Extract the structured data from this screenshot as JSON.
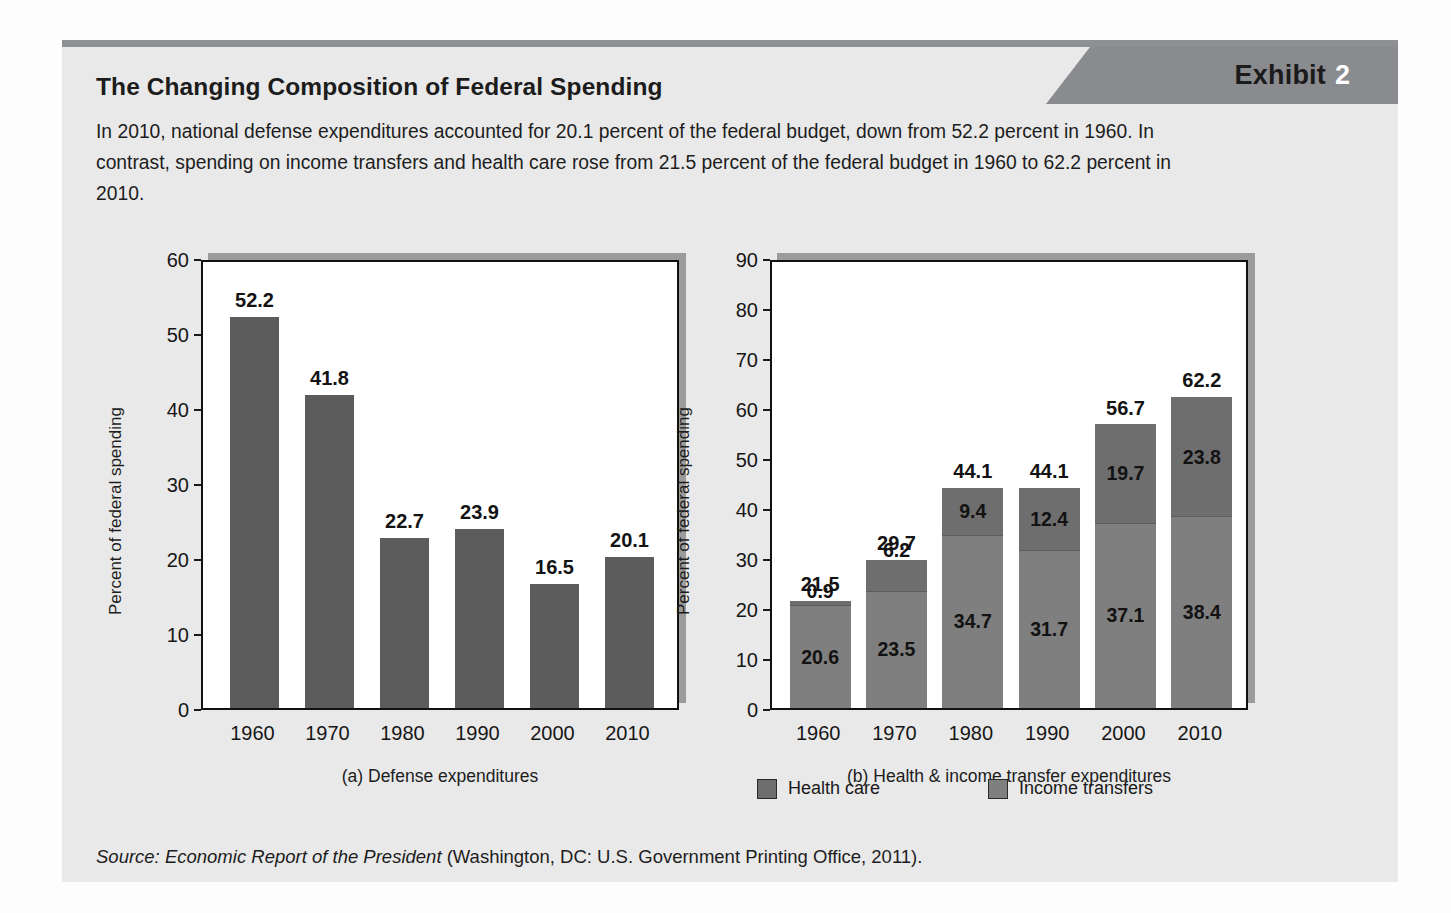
{
  "exhibit": {
    "banner_word": "Exhibit",
    "banner_number": "2",
    "title": "The Changing Composition of Federal Spending",
    "description": "In 2010, national defense expenditures accounted for 20.1 percent of the federal budget, down from 52.2 percent in 1960. In contrast, spending on income transfers and health care rose from 21.5 percent of the federal budget in 1960 to 62.2 percent in 2010.",
    "source_prefix": "Source: ",
    "source_italic": "Economic Report of the President",
    "source_rest": " (Washington, DC: U.S. Government Printing Office, 2011)."
  },
  "colors": {
    "panel_bg": "#e9e9e9",
    "banner": "#8a8b8e",
    "topbar": "#8f9093",
    "defense_bar": "#5c5c5c",
    "health_care": "#6e6e6e",
    "income_transfers": "#7f7f7f",
    "plot_shadow": "#9b9b9b"
  },
  "legend": {
    "items": [
      {
        "label": "Health care",
        "color": "#6e6e6e",
        "key": "health"
      },
      {
        "label": "Income transfers",
        "color": "#7f7f7f",
        "key": "income"
      }
    ]
  },
  "chart_data": [
    {
      "type": "bar",
      "id": "chart-a",
      "title": "(a) Defense expenditures",
      "xlabel": "",
      "ylabel": "Percent of federal spending",
      "ylim": [
        0,
        60
      ],
      "yticks": [
        0,
        10,
        20,
        30,
        40,
        50,
        60
      ],
      "grid": false,
      "legend": "none",
      "categories": [
        "1960",
        "1970",
        "1980",
        "1990",
        "2000",
        "2010"
      ],
      "values": [
        52.2,
        41.8,
        22.7,
        23.9,
        16.5,
        20.1
      ],
      "value_labels": [
        "52.2",
        "41.8",
        "22.7",
        "23.9",
        "16.5",
        "20.1"
      ]
    },
    {
      "type": "bar",
      "id": "chart-b",
      "subtype": "stacked",
      "title": "(b) Health & income transfer expenditures",
      "xlabel": "",
      "ylabel": "Percent of federal spending",
      "ylim": [
        0,
        90
      ],
      "yticks": [
        0,
        10,
        20,
        30,
        40,
        50,
        60,
        70,
        80,
        90
      ],
      "grid": false,
      "legend": "bottom",
      "categories": [
        "1960",
        "1970",
        "1980",
        "1990",
        "2000",
        "2010"
      ],
      "series": [
        {
          "name": "Income transfers",
          "values": [
            20.6,
            23.5,
            34.7,
            31.7,
            37.1,
            38.4
          ],
          "labels": [
            "20.6",
            "23.5",
            "34.7",
            "31.7",
            "37.1",
            "38.4"
          ]
        },
        {
          "name": "Health care",
          "values": [
            0.9,
            6.2,
            9.4,
            12.4,
            19.7,
            23.8
          ],
          "labels": [
            "0.9",
            "6.2",
            "9.4",
            "12.4",
            "19.7",
            "23.8"
          ]
        }
      ],
      "totals": [
        21.5,
        29.7,
        44.1,
        44.1,
        56.7,
        62.2
      ],
      "total_labels": [
        "21.5",
        "29.7",
        "44.1",
        "44.1",
        "56.7",
        "62.2"
      ]
    }
  ]
}
